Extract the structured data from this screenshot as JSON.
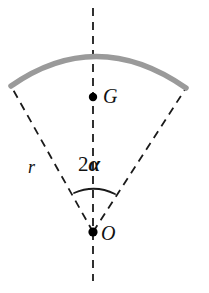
{
  "figure": {
    "type": "geometry-diagram",
    "background_color": "#ffffff",
    "width": 209,
    "height": 293,
    "labels": {
      "centroid": "G",
      "origin": "O",
      "radius": "r",
      "angle": "2",
      "angle_symbol": "α"
    },
    "colors": {
      "arc": "#9a9a9a",
      "dashed_line": "#1a1a1a",
      "point": "#000000",
      "text": "#111111"
    },
    "geometry": {
      "vertex": {
        "x": 93,
        "y": 232
      },
      "centroid_point": {
        "x": 93,
        "y": 97
      },
      "arc_left_end": {
        "x": 11,
        "y": 86
      },
      "arc_right_end": {
        "x": 186,
        "y": 88
      },
      "arc_apex": {
        "x": 96,
        "y": 62
      },
      "axis_top": {
        "x": 93,
        "y": 8
      },
      "axis_bottom": {
        "x": 93,
        "y": 281
      },
      "angle_arc_left": {
        "x": 74,
        "y": 193
      },
      "angle_arc_right": {
        "x": 115,
        "y": 194
      },
      "angle_arc_apex": {
        "x": 95,
        "y": 188
      },
      "radius_px": 170,
      "half_angle_deg": 30,
      "arc_stroke_width": 5,
      "dash_pattern": "8 6"
    }
  }
}
